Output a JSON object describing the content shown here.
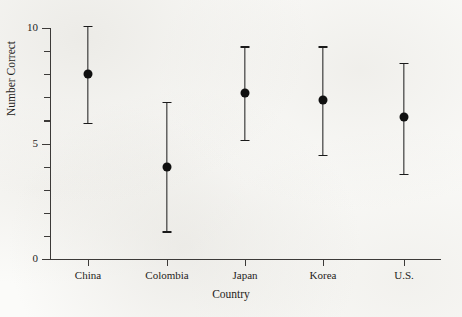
{
  "chart_data": {
    "type": "scatter",
    "title": "",
    "xlabel": "Country",
    "ylabel": "Number Correct",
    "categories": [
      "China",
      "Colombia",
      "Japan",
      "Korea",
      "U.S."
    ],
    "values": [
      8.0,
      4.0,
      7.2,
      6.9,
      6.15
    ],
    "error_low": [
      5.9,
      1.2,
      5.15,
      4.5,
      3.7
    ],
    "error_high": [
      10.1,
      6.8,
      9.2,
      9.2,
      8.5
    ],
    "series": [
      {
        "name": "Number Correct",
        "values": [
          8.0,
          4.0,
          7.2,
          6.9,
          6.15
        ],
        "error_low": [
          5.9,
          1.2,
          5.15,
          4.5,
          3.7
        ],
        "error_high": [
          10.1,
          6.8,
          9.2,
          9.2,
          8.5
        ]
      }
    ],
    "ylim": [
      0,
      10
    ],
    "ytick_labels": [
      "0",
      "5",
      "10"
    ],
    "ytick_values": [
      0,
      5,
      10
    ],
    "yminor_ticks": [
      1,
      2,
      3,
      4,
      6,
      7,
      8,
      9
    ],
    "grid": false,
    "legend": "none",
    "marker": "filled-circle",
    "errorbar_style": "capped-vertical"
  },
  "axes": {
    "y_title": "Number Correct",
    "x_title": "Country",
    "y_labels": [
      "10",
      "5",
      "0"
    ],
    "x_labels": [
      "China",
      "Colombia",
      "Japan",
      "Korea",
      "U.S."
    ]
  },
  "colors": {
    "marker": "#101010",
    "axis": "#3c3a38",
    "background": "#fbfbf9",
    "text": "#1f1d1b"
  }
}
